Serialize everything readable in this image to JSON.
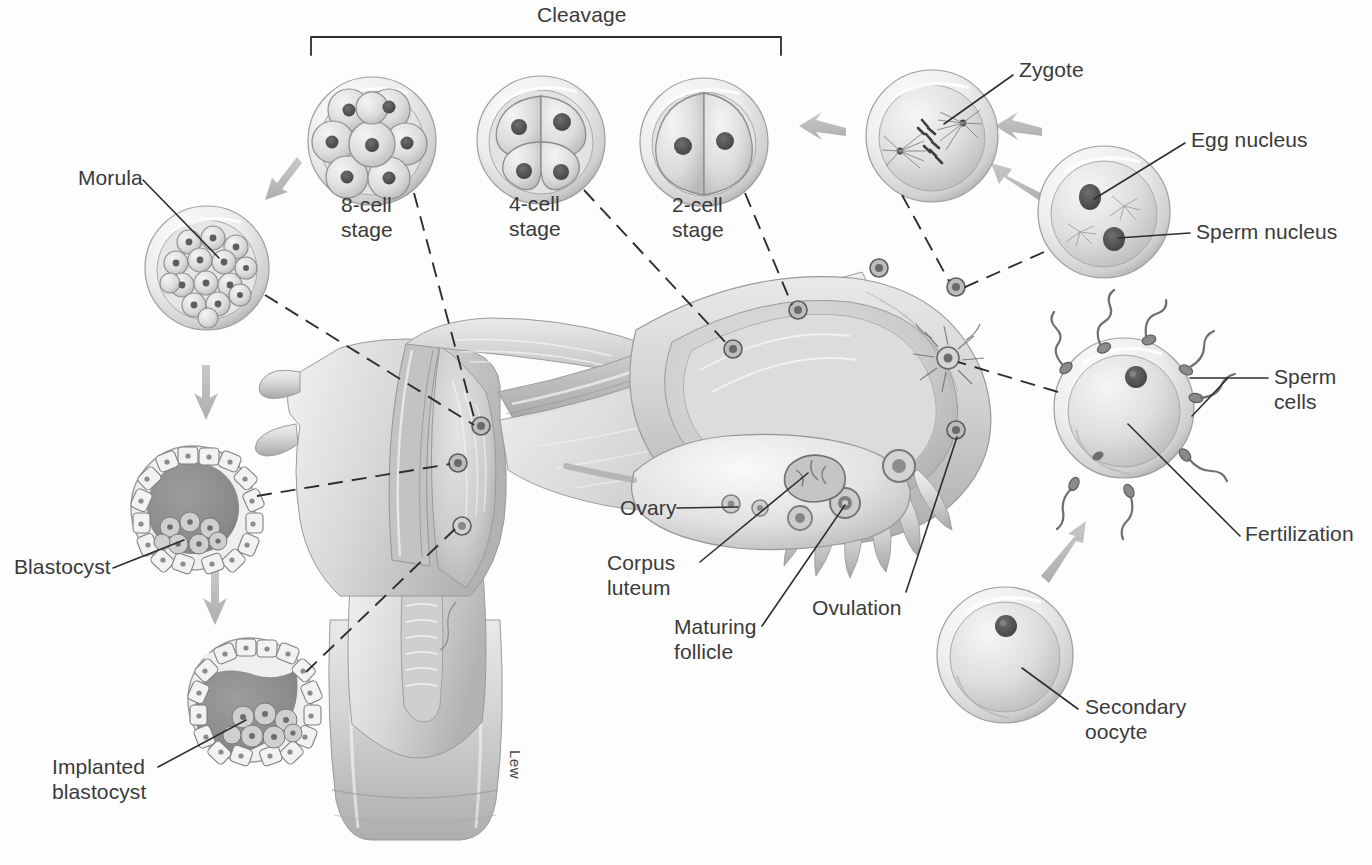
{
  "figure": {
    "background_color": "#fdfdfd",
    "text_color": "#3a3a3a",
    "arrow_color": "#b9b9b9",
    "leader_color": "#2e2e2e",
    "artist_signature": "Lew"
  },
  "bracket": {
    "label": "Cleavage",
    "x1": 311,
    "x2": 781,
    "y": 37,
    "tick_height": 18
  },
  "labels": {
    "cleavage": "Cleavage",
    "eight_cell": "8-cell\nstage",
    "four_cell": "4-cell\nstage",
    "two_cell": "2-cell\nstage",
    "zygote": "Zygote",
    "egg_nucleus": "Egg nucleus",
    "sperm_nucleus": "Sperm nucleus",
    "sperm_cells": "Sperm\ncells",
    "fertilization": "Fertilization",
    "secondary_oocyte": "Secondary\noocyte",
    "ovulation": "Ovulation",
    "maturing_follicle": "Maturing\nfollicle",
    "corpus_luteum": "Corpus\nluteum",
    "ovary": "Ovary",
    "morula": "Morula",
    "blastocyst": "Blastocyst",
    "implanted_blastocyst": "Implanted\nblastocyst"
  },
  "stages": [
    {
      "name": "secondary-oocyte",
      "label": "Secondary\noocyte",
      "cx": 1005,
      "cy": 655,
      "r": 68,
      "order": 1
    },
    {
      "name": "fertilization",
      "label": "Fertilization",
      "cx": 1124,
      "cy": 408,
      "r": 70,
      "order": 2
    },
    {
      "name": "pronuclei-ovum",
      "label": "Egg nucleus / Sperm nucleus",
      "cx": 1104,
      "cy": 212,
      "r": 66,
      "order": 3
    },
    {
      "name": "zygote",
      "label": "Zygote",
      "cx": 932,
      "cy": 136,
      "r": 66,
      "order": 4
    },
    {
      "name": "two-cell",
      "label": "2-cell\nstage",
      "cx": 704,
      "cy": 142,
      "r": 64,
      "order": 5
    },
    {
      "name": "four-cell",
      "label": "4-cell\nstage",
      "cx": 541,
      "cy": 140,
      "r": 64,
      "order": 6
    },
    {
      "name": "eight-cell",
      "label": "8-cell\nstage",
      "cx": 372,
      "cy": 141,
      "r": 64,
      "order": 7
    },
    {
      "name": "morula",
      "label": "Morula",
      "cx": 207,
      "cy": 268,
      "r": 62,
      "order": 8
    },
    {
      "name": "blastocyst",
      "label": "Blastocyst",
      "cx": 193,
      "cy": 508,
      "r": 62,
      "order": 9
    },
    {
      "name": "implanted-blastocyst",
      "label": "Implanted\nblastocyst",
      "cx": 250,
      "cy": 700,
      "r": 62,
      "order": 10
    }
  ],
  "anatomy": [
    {
      "name": "ovary",
      "label": "Ovary"
    },
    {
      "name": "corpus-luteum",
      "label": "Corpus\nluteum"
    },
    {
      "name": "maturing-follicle",
      "label": "Maturing\nfollicle"
    },
    {
      "name": "ovulation",
      "label": "Ovulation"
    },
    {
      "name": "uterine-tube",
      "label": "uterine tube"
    },
    {
      "name": "fimbriae",
      "label": "fimbriae"
    },
    {
      "name": "uterus",
      "label": "uterus"
    },
    {
      "name": "cervix",
      "label": "cervix"
    },
    {
      "name": "vagina",
      "label": "vagina"
    }
  ],
  "flow_arrows": [
    {
      "name": "arrow-oocyte-to-fertilization",
      "direction": "up-right"
    },
    {
      "name": "arrow-fertilization-to-pronuclei",
      "direction": "up-left"
    },
    {
      "name": "arrow-pronuclei-to-zygote",
      "direction": "left"
    },
    {
      "name": "arrow-zygote-to-two-cell",
      "direction": "left"
    },
    {
      "name": "arrow-eight-cell-to-morula",
      "direction": "down-left"
    },
    {
      "name": "arrow-morula-to-blastocyst",
      "direction": "down"
    },
    {
      "name": "arrow-blastocyst-to-implanted",
      "direction": "down"
    }
  ]
}
